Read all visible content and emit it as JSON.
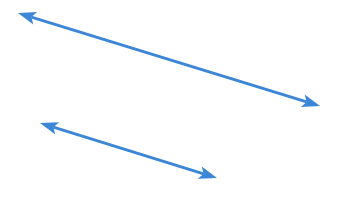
{
  "canvas": {
    "width": 352,
    "height": 216,
    "background_color": "#ffffff"
  },
  "shapes": {
    "title": "",
    "stroke_color": "#3b86d6",
    "arrow_head_color": "#3b86d6",
    "stroke_width": 3,
    "arrow_head_length": 18,
    "arrow_head_width": 13,
    "arrow_head_notch": 4,
    "items": [
      {
        "name": "upper-double-arrow",
        "label": "Upper double-headed arrow",
        "start_x": 18,
        "start_y": 13,
        "end_x": 320,
        "end_y": 106,
        "start_head": true,
        "end_head": true,
        "color": "#3b86d6",
        "stroke_width": 3
      },
      {
        "name": "lower-double-arrow",
        "label": "Lower double-headed arrow",
        "start_x": 40,
        "start_y": 123,
        "end_x": 217,
        "end_y": 178,
        "start_head": true,
        "end_head": true,
        "color": "#3b86d6",
        "stroke_width": 3
      }
    ]
  }
}
